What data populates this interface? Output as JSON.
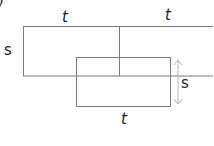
{
  "figure": {
    "corner_glyph": ")",
    "labels": {
      "top_left_width": "t",
      "top_right_width": "t",
      "left_height": "s",
      "right_height": "s",
      "bottom_width": "t"
    }
  },
  "colors": {
    "stroke": "#7a7a7a",
    "arrow": "#b5b5b5",
    "text": "#222222"
  }
}
